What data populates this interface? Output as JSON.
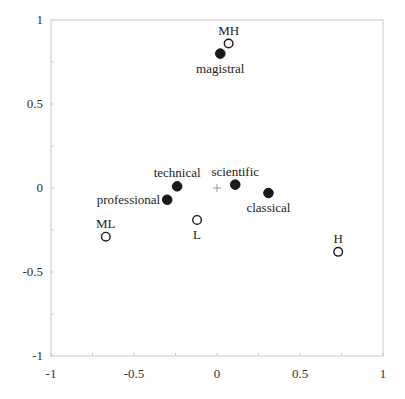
{
  "chart_data": {
    "type": "scatter",
    "title": "",
    "xlabel": "",
    "ylabel": "",
    "xlim": [
      -1,
      1
    ],
    "ylim": [
      -1,
      1
    ],
    "grid": false,
    "legend": null,
    "x_ticks": [
      -1,
      -0.5,
      0,
      0.5,
      1
    ],
    "x_tick_labels": [
      "-1",
      "-0.5",
      "0",
      "0.5",
      "1"
    ],
    "y_ticks": [
      1,
      0.5,
      0,
      -0.5,
      -1
    ],
    "y_tick_labels": [
      "1",
      "0.5",
      "0",
      "-0.5",
      "-1"
    ],
    "origin_marker": "+",
    "series": [
      {
        "name": "filled",
        "marker": "filled-circle",
        "points": [
          {
            "label": "magistral",
            "x": 0.02,
            "y": 0.8,
            "label_pos": "below"
          },
          {
            "label": "technical",
            "x": -0.24,
            "y": 0.01,
            "label_pos": "above"
          },
          {
            "label": "scientific",
            "x": 0.11,
            "y": 0.02,
            "label_pos": "above"
          },
          {
            "label": "professional",
            "x": -0.3,
            "y": -0.07,
            "label_pos": "left"
          },
          {
            "label": "classical",
            "x": 0.31,
            "y": -0.03,
            "label_pos": "below"
          }
        ]
      },
      {
        "name": "open",
        "marker": "open-circle",
        "points": [
          {
            "label": "MH",
            "x": 0.07,
            "y": 0.86,
            "label_pos": "above"
          },
          {
            "label": "ML",
            "x": -0.67,
            "y": -0.29,
            "label_pos": "above"
          },
          {
            "label": "L",
            "x": -0.12,
            "y": -0.19,
            "label_pos": "below"
          },
          {
            "label": "H",
            "x": 0.73,
            "y": -0.38,
            "label_pos": "above"
          }
        ]
      }
    ]
  }
}
